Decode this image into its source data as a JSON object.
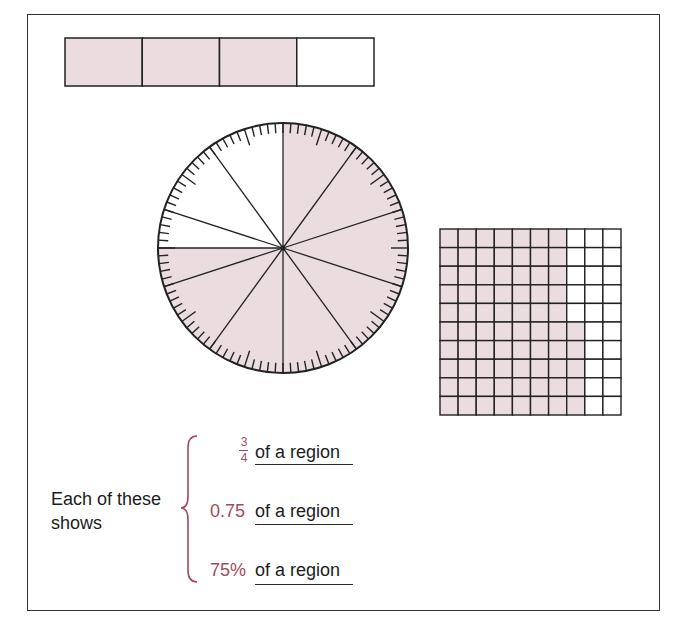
{
  "colors": {
    "shade": "#eadcdf",
    "stroke": "#222222",
    "accent": "#a24a5e",
    "text": "#1c1c1c"
  },
  "bar_model": {
    "total_parts": 4,
    "shaded_parts": 3,
    "x": 65,
    "y": 38,
    "width": 309,
    "height": 48
  },
  "circle_model": {
    "cx": 283,
    "cy": 248,
    "r": 125,
    "tick_count": 100,
    "long_tick_every": 5,
    "short_tick_len": 10,
    "long_tick_len": 17,
    "sector_line_angles_deg": [
      0,
      36,
      72,
      108,
      144,
      180,
      216,
      252,
      270,
      288,
      324
    ],
    "shaded_from_deg": 0,
    "shaded_to_deg": 270
  },
  "grid_model": {
    "rows": 10,
    "cols": 10,
    "shaded_full_columns": 7,
    "partial_column": 8,
    "partial_column_shaded_rows": [
      6,
      7,
      8,
      9,
      10
    ],
    "x": 440,
    "y": 229,
    "width": 181,
    "height": 186
  },
  "caption": {
    "lead_line1": "Each of these",
    "lead_line2": "shows",
    "items": [
      {
        "value_numerator": "3",
        "value_denominator": "4",
        "label": "of a region"
      },
      {
        "value": "0.75",
        "label": "of a region"
      },
      {
        "value": "75%",
        "label": "of a region"
      }
    ]
  }
}
